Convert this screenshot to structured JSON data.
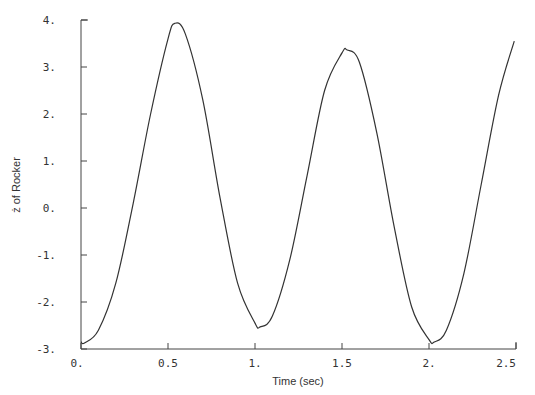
{
  "chart_data": {
    "type": "line",
    "title": "",
    "xlabel": "Time (sec)",
    "ylabel": "ż of Rocker",
    "xlim": [
      0,
      2.5
    ],
    "ylim": [
      -3,
      4
    ],
    "grid": false,
    "legend": null,
    "x_ticks": [
      0,
      0.5,
      1,
      1.5,
      2,
      2.5
    ],
    "x_tick_labels": [
      "0.",
      "0.5",
      "1.",
      "1.5",
      "2.",
      "2.5"
    ],
    "y_ticks": [
      -3,
      -2,
      -1,
      0,
      1,
      2,
      3,
      4
    ],
    "y_tick_labels": [
      "-3.",
      "-2.",
      "-1.",
      "0.",
      "1.",
      "2.",
      "3.",
      "4."
    ],
    "series": [
      {
        "name": "z_dot",
        "color": "#333333",
        "x": [
          0.0,
          0.02,
          0.1,
          0.2,
          0.3,
          0.4,
          0.5,
          0.54,
          0.6,
          0.7,
          0.8,
          0.9,
          1.0,
          1.03,
          1.1,
          1.2,
          1.3,
          1.4,
          1.5,
          1.53,
          1.6,
          1.7,
          1.8,
          1.9,
          2.0,
          2.03,
          2.1,
          2.2,
          2.3,
          2.4,
          2.49
        ],
        "y": [
          -2.85,
          -2.87,
          -2.6,
          -1.6,
          0.1,
          2.0,
          3.6,
          3.93,
          3.7,
          2.3,
          0.2,
          -1.6,
          -2.45,
          -2.53,
          -2.3,
          -1.1,
          0.7,
          2.5,
          3.3,
          3.36,
          3.1,
          1.6,
          -0.4,
          -2.1,
          -2.8,
          -2.85,
          -2.6,
          -1.4,
          0.5,
          2.4,
          3.55
        ]
      }
    ]
  }
}
